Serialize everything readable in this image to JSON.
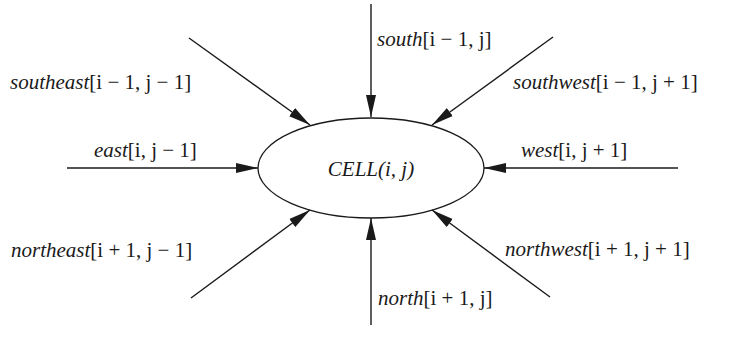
{
  "diagram": {
    "center_node": {
      "name": "CELL",
      "args": "(i, j)"
    },
    "inputs": [
      {
        "id": "south",
        "name": "south",
        "index": "[i − 1, j]"
      },
      {
        "id": "southeast",
        "name": "southeast",
        "index": "[i − 1, j − 1]"
      },
      {
        "id": "southwest",
        "name": "southwest",
        "index": "[i − 1, j + 1]"
      },
      {
        "id": "east",
        "name": "east",
        "index": "[i, j − 1]"
      },
      {
        "id": "west",
        "name": "west",
        "index": "[i, j + 1]"
      },
      {
        "id": "northeast",
        "name": "northeast",
        "index": "[i + 1, j − 1]"
      },
      {
        "id": "northwest",
        "name": "northwest",
        "index": "[i + 1, j + 1]"
      },
      {
        "id": "north",
        "name": "north",
        "index": "[i + 1, j]"
      }
    ],
    "colors": {
      "stroke": "#1a1a1a",
      "background": "#ffffff"
    }
  }
}
